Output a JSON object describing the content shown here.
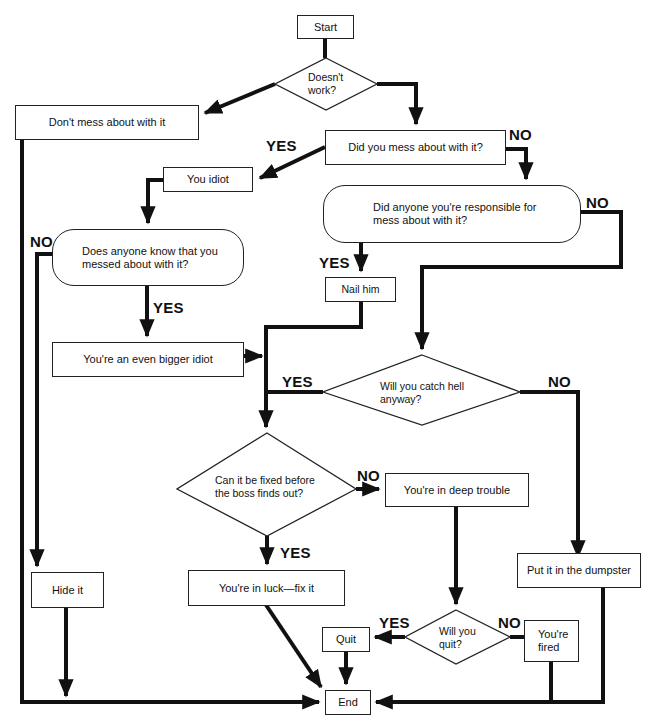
{
  "flowchart": {
    "nodes": {
      "start": {
        "label": "Start",
        "shape": "rect"
      },
      "doesnt_work": {
        "label": "Doesn't work?",
        "line1": "Doesn't",
        "line2": "work?",
        "shape": "diamond"
      },
      "dont_mess": {
        "label": "Don't mess about with it",
        "shape": "rect"
      },
      "did_you_mess": {
        "label": "Did you mess about with it?",
        "shape": "rect"
      },
      "you_idiot": {
        "label": "You idiot",
        "shape": "rect"
      },
      "did_anyone_responsible": {
        "label": "Did anyone you're responsible for mess about with it?",
        "line1": "Did anyone you're responsible for",
        "line2": "mess about with it?",
        "shape": "rounded"
      },
      "does_anyone_know": {
        "label": "Does anyone know that you messed about with it?",
        "line1": "Does anyone know that you",
        "line2": "messed about with it?",
        "shape": "rounded"
      },
      "nail_him": {
        "label": "Nail him",
        "shape": "rect"
      },
      "bigger_idiot": {
        "label": "You're an even bigger idiot",
        "shape": "rect"
      },
      "catch_hell": {
        "label": "Will you catch hell anyway?",
        "line1": "Will you catch hell",
        "line2": "anyway?",
        "shape": "diamond"
      },
      "can_be_fixed": {
        "label": "Can it be fixed before the boss finds out?",
        "line1": "Can it be fixed before",
        "line2": "the boss finds out?",
        "shape": "diamond"
      },
      "deep_trouble": {
        "label": "You're in deep trouble",
        "shape": "rect"
      },
      "dumpster": {
        "label": "Put it in the dumpster",
        "shape": "rect"
      },
      "hide_it": {
        "label": "Hide it",
        "shape": "rect"
      },
      "in_luck": {
        "label": "You're in luck—fix it",
        "shape": "rect"
      },
      "will_you_quit": {
        "label": "Will you quit?",
        "line1": "Will you",
        "line2": "quit?",
        "shape": "diamond"
      },
      "quit": {
        "label": "Quit",
        "shape": "rect"
      },
      "fired": {
        "label": "You're fired",
        "line1": "You're",
        "line2": "fired",
        "shape": "rect"
      },
      "end": {
        "label": "End",
        "shape": "rect"
      }
    },
    "edge_labels": {
      "did_you_mess_yes": "YES",
      "did_you_mess_no": "NO",
      "responsible_no": "NO",
      "responsible_yes": "YES",
      "know_no": "NO",
      "know_yes": "YES",
      "catch_hell_yes": "YES",
      "catch_hell_no": "NO",
      "fixed_no": "NO",
      "fixed_yes": "YES",
      "quit_yes": "YES",
      "quit_no": "NO"
    },
    "edges": [
      {
        "from": "start",
        "to": "doesnt_work"
      },
      {
        "from": "doesnt_work",
        "to": "dont_mess"
      },
      {
        "from": "doesnt_work",
        "to": "did_you_mess"
      },
      {
        "from": "did_you_mess",
        "to": "you_idiot",
        "label": "YES"
      },
      {
        "from": "did_you_mess",
        "to": "did_anyone_responsible",
        "label": "NO"
      },
      {
        "from": "you_idiot",
        "to": "does_anyone_know"
      },
      {
        "from": "did_anyone_responsible",
        "to": "nail_him",
        "label": "YES"
      },
      {
        "from": "did_anyone_responsible",
        "to": "catch_hell",
        "label": "NO"
      },
      {
        "from": "does_anyone_know",
        "to": "bigger_idiot",
        "label": "YES"
      },
      {
        "from": "does_anyone_know",
        "to": "hide_it",
        "label": "NO"
      },
      {
        "from": "nail_him",
        "to": "can_be_fixed"
      },
      {
        "from": "bigger_idiot",
        "to": "can_be_fixed"
      },
      {
        "from": "catch_hell",
        "to": "can_be_fixed",
        "label": "YES"
      },
      {
        "from": "catch_hell",
        "to": "dumpster",
        "label": "NO"
      },
      {
        "from": "can_be_fixed",
        "to": "deep_trouble",
        "label": "NO"
      },
      {
        "from": "can_be_fixed",
        "to": "in_luck",
        "label": "YES"
      },
      {
        "from": "deep_trouble",
        "to": "will_you_quit"
      },
      {
        "from": "will_you_quit",
        "to": "quit",
        "label": "YES"
      },
      {
        "from": "will_you_quit",
        "to": "fired",
        "label": "NO"
      },
      {
        "from": "dont_mess",
        "to": "end"
      },
      {
        "from": "hide_it",
        "to": "end"
      },
      {
        "from": "in_luck",
        "to": "end"
      },
      {
        "from": "quit",
        "to": "end"
      },
      {
        "from": "fired",
        "to": "end"
      },
      {
        "from": "dumpster",
        "to": "end"
      }
    ],
    "colors": {
      "line": "#111111",
      "box_border": "#222222",
      "background": "#ffffff"
    }
  }
}
